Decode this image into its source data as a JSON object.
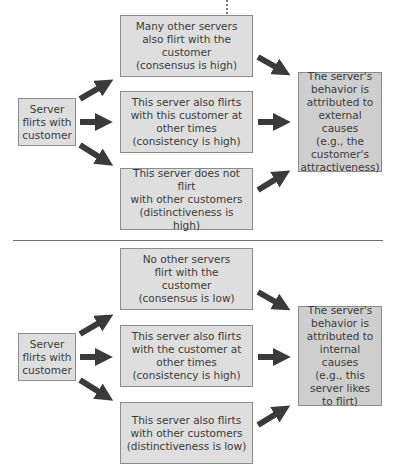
{
  "colors": {
    "box_fill": "#dedede",
    "result_fill": "#cecece",
    "border": "#8c8c8c",
    "arrow": "#3a3a3a",
    "divider": "#6e6e6e"
  },
  "panels": [
    {
      "source": "Server\nflirts with\ncustomer",
      "conditions": [
        "Many other servers\nalso flirt with the\ncustomer\n(consensus is high)",
        "This server also flirts\nwith this customer at\nother times\n(consistency is high)",
        "This server does not flirt\nwith other customers\n(distinctiveness is high)"
      ],
      "result": "The server's\nbehavior is\nattributed to\nexternal causes\n(e.g., the\ncustomer's\nattractiveness)"
    },
    {
      "source": "Server\nflirts with\ncustomer",
      "conditions": [
        "No other servers\nflirt with the\ncustomer\n(consensus is low)",
        "This server also flirts\nwith the customer at\nother times\n(consistency is high)",
        "This server also flirts\nwith other customers\n(distinctiveness is low)"
      ],
      "result": "The server's\nbehavior is\nattributed to\ninternal causes\n(e.g., this\nserver likes\nto flirt)"
    }
  ]
}
